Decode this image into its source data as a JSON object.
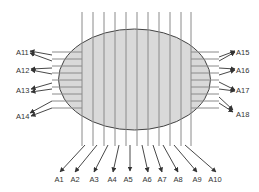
{
  "diagram": {
    "colors": {
      "ellipse_fill": "#d9d9d9",
      "ellipse_stroke": "#444444",
      "grid_line": "#8a8a8a",
      "arrow": "#333333",
      "label": "#333333"
    },
    "ellipse": {
      "cx": 134.5,
      "cy": 79.5,
      "rx": 76,
      "ry": 50.5
    },
    "vertical_lines": {
      "x": [
        82,
        93,
        104,
        115,
        126,
        137,
        148,
        159,
        170,
        181,
        191
      ],
      "y1": 12,
      "y2": 146
    },
    "left_lines": {
      "x1": 52,
      "x2": 82,
      "y": [
        52,
        59,
        66,
        73,
        80,
        87,
        94,
        101,
        108
      ]
    },
    "right_lines": {
      "x1": 191,
      "x2": 219,
      "y": [
        52,
        59,
        66,
        73,
        80,
        87,
        94,
        101,
        108
      ]
    },
    "bottom_labels": [
      {
        "text": "A1",
        "x": 59,
        "y": 182
      },
      {
        "text": "A2",
        "x": 75,
        "y": 182
      },
      {
        "text": "A3",
        "x": 94,
        "y": 182
      },
      {
        "text": "A4",
        "x": 112,
        "y": 182
      },
      {
        "text": "A5",
        "x": 128,
        "y": 182
      },
      {
        "text": "A6",
        "x": 147,
        "y": 182
      },
      {
        "text": "A7",
        "x": 162,
        "y": 182
      },
      {
        "text": "A8",
        "x": 178,
        "y": 182
      },
      {
        "text": "A9",
        "x": 197,
        "y": 182
      },
      {
        "text": "A10",
        "x": 215,
        "y": 182
      }
    ],
    "left_labels": [
      {
        "text": "A11",
        "x": 16,
        "y": 55
      },
      {
        "text": "A12",
        "x": 16,
        "y": 73
      },
      {
        "text": "A13",
        "x": 16,
        "y": 93
      },
      {
        "text": "A14",
        "x": 16,
        "y": 119
      }
    ],
    "right_labels": [
      {
        "text": "A15",
        "x": 236,
        "y": 55
      },
      {
        "text": "A16",
        "x": 236,
        "y": 73
      },
      {
        "text": "A17",
        "x": 236,
        "y": 93
      },
      {
        "text": "A18",
        "x": 236,
        "y": 117
      }
    ],
    "bottom_arrows": [
      {
        "from": [
          85,
          145
        ],
        "to": [
          60,
          172
        ]
      },
      {
        "from": [
          97,
          145
        ],
        "to": [
          75,
          172
        ]
      },
      {
        "from": [
          108,
          145
        ],
        "to": [
          94,
          172
        ]
      },
      {
        "from": [
          119,
          145
        ],
        "to": [
          113,
          172
        ]
      },
      {
        "from": [
          130,
          145
        ],
        "to": [
          130,
          171
        ]
      },
      {
        "from": [
          142,
          145
        ],
        "to": [
          148,
          172
        ]
      },
      {
        "from": [
          153,
          145
        ],
        "to": [
          162,
          172
        ]
      },
      {
        "from": [
          163,
          145
        ],
        "to": [
          178,
          172
        ]
      },
      {
        "from": [
          174,
          145
        ],
        "to": [
          197,
          172
        ]
      },
      {
        "from": [
          185,
          145
        ],
        "to": [
          216,
          172
        ]
      }
    ],
    "left_arrows": [
      {
        "from": [
          52,
          55
        ],
        "to": [
          30,
          51
        ]
      },
      {
        "from": [
          52,
          61
        ],
        "to": [
          30,
          53
        ]
      },
      {
        "from": [
          52,
          68
        ],
        "to": [
          31,
          69
        ]
      },
      {
        "from": [
          52,
          74
        ],
        "to": [
          31,
          70
        ]
      },
      {
        "from": [
          52,
          83
        ],
        "to": [
          31,
          89
        ]
      },
      {
        "from": [
          52,
          89
        ],
        "to": [
          31,
          92
        ]
      },
      {
        "from": [
          52,
          101
        ],
        "to": [
          30,
          113
        ]
      },
      {
        "from": [
          52,
          108
        ],
        "to": [
          31,
          116
        ]
      }
    ],
    "right_arrows": [
      {
        "from": [
          219,
          57
        ],
        "to": [
          235,
          51
        ]
      },
      {
        "from": [
          219,
          61
        ],
        "to": [
          235,
          52
        ]
      },
      {
        "from": [
          219,
          68
        ],
        "to": [
          235,
          69
        ]
      },
      {
        "from": [
          219,
          75
        ],
        "to": [
          235,
          70
        ]
      },
      {
        "from": [
          219,
          82
        ],
        "to": [
          235,
          90
        ]
      },
      {
        "from": [
          219,
          89
        ],
        "to": [
          235,
          91
        ]
      },
      {
        "from": [
          219,
          97
        ],
        "to": [
          233,
          110
        ]
      },
      {
        "from": [
          219,
          103
        ],
        "to": [
          233,
          112
        ]
      }
    ]
  }
}
